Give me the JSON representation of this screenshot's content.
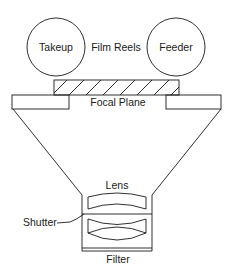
{
  "diagram": {
    "colors": {
      "line": "#1a1a1a",
      "background": "#ffffff"
    },
    "reels": {
      "group_label": "Film Reels",
      "takeup": {
        "label": "Takeup"
      },
      "feeder": {
        "label": "Feeder"
      }
    },
    "film_strip": {
      "pattern": "diagonal-hatch"
    },
    "focal_plane": {
      "label": "Focal Plane"
    },
    "lens": {
      "label": "Lens"
    },
    "shutter": {
      "label": "Shutter"
    },
    "filter": {
      "label": "Filter"
    }
  }
}
